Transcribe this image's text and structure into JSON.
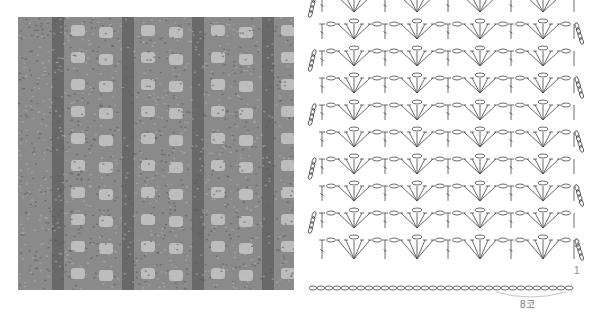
{
  "photo": {
    "description": "Crochet swatch photo (gray yarn, lace fan pattern)",
    "yarn_color": "#8a8a8a",
    "hole_color": "#c9c9c9",
    "rib_color": "#4e4e4e"
  },
  "chart": {
    "rows": 10,
    "repeats_per_row": 4,
    "line_color": "#444444",
    "row_labels": [
      {
        "label": "2",
        "row": 2
      },
      {
        "label": "1",
        "row": 1
      }
    ],
    "repeat_label": "8코",
    "foundation_chain_count": 33
  }
}
